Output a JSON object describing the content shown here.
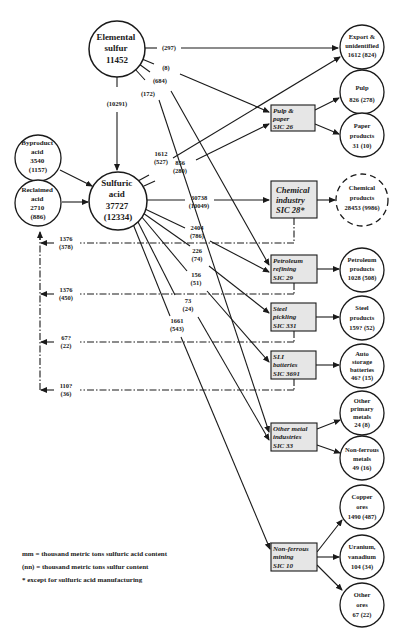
{
  "diagram": {
    "type": "flow",
    "colors": {
      "line": "#1a1a1a",
      "box_fill": "#e6e6e6",
      "background": "#ffffff"
    },
    "sources": {
      "elemental_sulfur": {
        "lines": [
          "Elemental",
          "sulfur",
          "11452"
        ]
      },
      "byproduct_acid": {
        "lines": [
          "Byproduct",
          "acid",
          "3540",
          "(1157)"
        ]
      },
      "reclaimed_acid": {
        "lines": [
          "Reclaimed",
          "acid",
          "2710",
          "(886)"
        ]
      },
      "sulfuric_acid": {
        "lines": [
          "Sulfuric",
          "acid",
          "37727",
          "(12334)"
        ]
      }
    },
    "industries": [
      {
        "id": "pulp_paper",
        "lines": [
          "Pulp &",
          "paper",
          "SIC 26"
        ]
      },
      {
        "id": "chemical",
        "lines": [
          "Chemical",
          "industry",
          "SIC 28*"
        ]
      },
      {
        "id": "petroleum",
        "lines": [
          "Petroleum",
          "refining",
          "SIC 29"
        ]
      },
      {
        "id": "steel",
        "lines": [
          "Steel",
          "pickling",
          "SIC 331"
        ]
      },
      {
        "id": "sli",
        "lines": [
          "SLI",
          "batteries",
          "SIC 3691"
        ]
      },
      {
        "id": "other_metal",
        "lines": [
          "Other metal",
          "industries",
          "SIC 33"
        ]
      },
      {
        "id": "nonferrous_mining",
        "lines": [
          "Non-ferrous",
          "mining",
          "SIC 10"
        ]
      }
    ],
    "products": [
      {
        "id": "export",
        "lines": [
          "Export &",
          "unidentified",
          "1612 (824)"
        ]
      },
      {
        "id": "pulp",
        "lines": [
          "Pulp",
          "826 (278)"
        ]
      },
      {
        "id": "paper",
        "lines": [
          "Paper",
          "products",
          "31 (10)"
        ]
      },
      {
        "id": "chemical_products",
        "lines": [
          "Chemical",
          "products",
          "28453 (9986)"
        ]
      },
      {
        "id": "petroleum_products",
        "lines": [
          "Petroleum",
          "products",
          "1028 (508)"
        ]
      },
      {
        "id": "steel_products",
        "lines": [
          "Steel",
          "products",
          "159? (52)"
        ]
      },
      {
        "id": "auto_batteries",
        "lines": [
          "Auto",
          "storage",
          "batteries",
          "46? (15)"
        ]
      },
      {
        "id": "other_primary",
        "lines": [
          "Other",
          "primary",
          "metals",
          "24 (8)"
        ]
      },
      {
        "id": "nonferrous_metals",
        "lines": [
          "Non-ferrous",
          "metals",
          "49 (16)"
        ]
      },
      {
        "id": "copper_ores",
        "lines": [
          "Copper",
          "ores",
          "1490 (487)"
        ]
      },
      {
        "id": "uranium",
        "lines": [
          "Uranium,",
          "vanadium",
          "104 (34)"
        ]
      },
      {
        "id": "other_ores",
        "lines": [
          "Other",
          "ores",
          "67 (22)"
        ]
      }
    ],
    "sulfur_flows": {
      "to_export": "(297)",
      "to_pulp_paper": "(8)",
      "to_petroleum": "(684)",
      "to_other_metal": "(172)",
      "to_sulfuric_acid": "(10291)"
    },
    "acid_flows": {
      "export": [
        "1612",
        "(527)"
      ],
      "pulp_paper": [
        "856",
        "(280)"
      ],
      "chemical": [
        "30738",
        "(10049)"
      ],
      "petroleum": [
        "2404",
        "(786)"
      ],
      "steel": [
        "226",
        "(74)"
      ],
      "sli": [
        "156",
        "(51)"
      ],
      "other_metal": [
        "73",
        "(24)"
      ],
      "nonferrous_mining": [
        "1661",
        "(543)"
      ]
    },
    "reclaim_flows": {
      "chemical": [
        "1376",
        "(378)"
      ],
      "petroleum": [
        "1376",
        "(450)"
      ],
      "steel": [
        "67?",
        "(22)"
      ],
      "sli": [
        "110?",
        "(36)"
      ]
    },
    "legend": [
      "mm = thousand metric tons sulfuric acid content",
      "(nn) = thousand metric tons sulfur content",
      "* except for sulfuric acid manufacturing"
    ]
  }
}
